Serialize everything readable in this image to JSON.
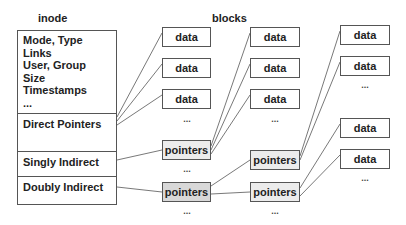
{
  "titles": {
    "inode": "inode",
    "blocks": "blocks"
  },
  "inode": {
    "metadata_lines": [
      "Mode, Type",
      "Links",
      "User, Group",
      "Size",
      "Timestamps",
      "..."
    ],
    "direct": "Direct Pointers",
    "singly": "Singly Indirect",
    "doubly": "Doubly Indirect"
  },
  "blocks": {
    "data_label": "data",
    "pointers_label": "pointers",
    "ellipsis": "..."
  },
  "colors": {
    "pointer_fill_light": "#ececec",
    "pointer_fill_dark": "#d8d8d8",
    "line": "#555555"
  }
}
